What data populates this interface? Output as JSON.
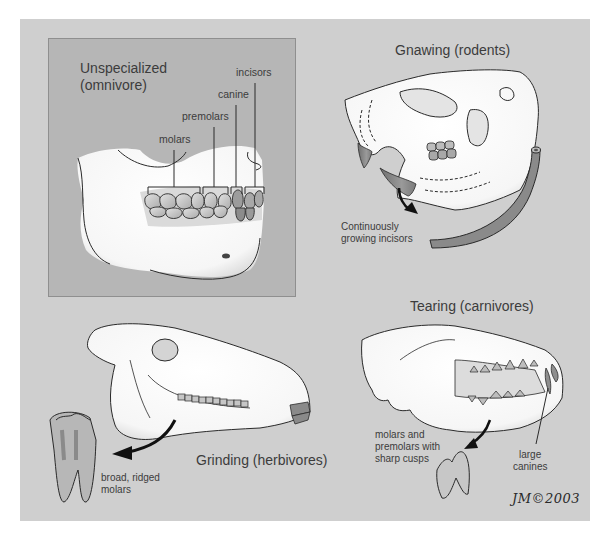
{
  "figure": {
    "sections": [
      {
        "id": "omnivore",
        "title_line1": "Unspecialized",
        "title_line2": "(omnivore)",
        "labels": [
          "incisors",
          "canine",
          "premolars",
          "molars"
        ]
      },
      {
        "id": "rodent",
        "title": "Gnawing (rodents)",
        "note_line1": "Continuously",
        "note_line2": "growing incisors"
      },
      {
        "id": "herbivore",
        "title": "Grinding (herbivores)",
        "note_line1": "broad, ridged",
        "note_line2": "molars"
      },
      {
        "id": "carnivore",
        "title": "Tearing (carnivores)",
        "note_line1": "molars and",
        "note_line2": "premolars with",
        "note_line3": "sharp cusps",
        "canine_line1": "large",
        "canine_line2": "canines"
      }
    ],
    "signature": "JM©2003",
    "colors": {
      "outer_panel": "#cfcfcf",
      "inner_panel": "#b6b6b6",
      "bone": "#ffffff",
      "tooth": "#c8c8c8",
      "incisor": "#8e8e8e",
      "ink": "#2a2a2a",
      "text": "#3c3c3c"
    }
  }
}
